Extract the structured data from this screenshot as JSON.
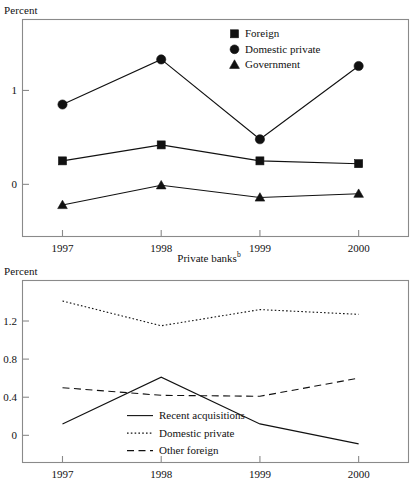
{
  "figure": {
    "panels": [
      {
        "id": "state-banks",
        "ylabel": "Percent",
        "caption": "",
        "caption_superscript": ""
      },
      {
        "id": "private-banks",
        "ylabel": "Percent",
        "caption": "Private banks",
        "caption_superscript": "b"
      }
    ]
  },
  "chart_data": [
    {
      "type": "line",
      "panel": "top",
      "title": "",
      "xlabel": "",
      "ylabel": "Percent",
      "categories": [
        "1997",
        "1998",
        "1999",
        "2000"
      ],
      "x": [
        1997,
        1998,
        1999,
        2000
      ],
      "xlim": [
        1996.6,
        2000.5
      ],
      "ylim": [
        -0.55,
        1.75
      ],
      "yticks": [
        0,
        1
      ],
      "ytick_labels": [
        "0",
        "1"
      ],
      "grid": false,
      "legend_position": "top-center",
      "series": [
        {
          "name": "Foreign",
          "marker": "square",
          "linestyle": "solid",
          "values": [
            0.25,
            0.42,
            0.25,
            0.22
          ]
        },
        {
          "name": "Domestic private",
          "marker": "circle",
          "linestyle": "solid",
          "values": [
            0.85,
            1.33,
            0.48,
            1.26
          ]
        },
        {
          "name": "Government",
          "marker": "triangle",
          "linestyle": "solid",
          "values": [
            -0.22,
            -0.01,
            -0.14,
            -0.1
          ]
        }
      ]
    },
    {
      "type": "line",
      "panel": "bottom",
      "title": "Private banks",
      "xlabel": "",
      "ylabel": "Percent",
      "categories": [
        "1997",
        "1998",
        "1999",
        "2000"
      ],
      "x": [
        1997,
        1998,
        1999,
        2000
      ],
      "xlim": [
        1996.6,
        2000.5
      ],
      "ylim": [
        -0.28,
        1.62
      ],
      "yticks": [
        0,
        0.4,
        0.8,
        1.2
      ],
      "ytick_labels": [
        "0",
        "0.4",
        "0.8",
        "1.2"
      ],
      "grid": false,
      "legend_position": "center",
      "series": [
        {
          "name": "Recent acquisitions",
          "marker": "none",
          "linestyle": "solid",
          "values": [
            0.12,
            0.61,
            0.12,
            -0.09
          ]
        },
        {
          "name": "Domestic private",
          "marker": "none",
          "linestyle": "dotted",
          "values": [
            1.41,
            1.15,
            1.32,
            1.27
          ]
        },
        {
          "name": "Other foreign",
          "marker": "none",
          "linestyle": "dashed",
          "values": [
            0.5,
            0.42,
            0.41,
            0.6
          ]
        }
      ]
    }
  ],
  "colors": {
    "ink": "#111111",
    "frame": "#8a8a8a",
    "background": "#ffffff"
  }
}
